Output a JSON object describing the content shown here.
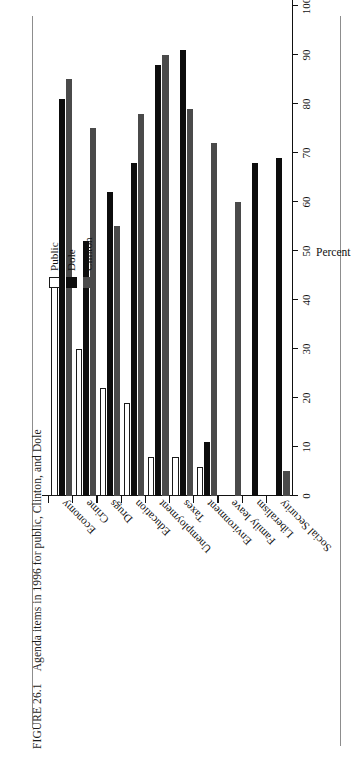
{
  "figure": {
    "number": "FIGURE 26.1",
    "caption": "Agenda items in 1996 for public, Clinton, and Dole"
  },
  "legend": {
    "position": "top-left-inside",
    "entries": [
      {
        "label": "Public",
        "color": "#ffffff",
        "style": "outlined"
      },
      {
        "label": "Dole",
        "color": "#0d0d0d",
        "style": "filled"
      },
      {
        "label": "Clinton",
        "color": "#4a4a4a",
        "style": "filled"
      }
    ]
  },
  "axes": {
    "value_title": "Percent",
    "value_ticks": [
      "0",
      "10",
      "20",
      "30",
      "40",
      "50",
      "60",
      "70",
      "80",
      "90",
      "100"
    ]
  },
  "chart_data": {
    "type": "bar",
    "orientation": "horizontal",
    "title": "Agenda items in 1996 for public, Clinton, and Dole",
    "xlabel": "",
    "ylabel": "Percent",
    "ylim": [
      0,
      100
    ],
    "grid": false,
    "legend_position": "top-left",
    "categories": [
      "Economy",
      "Crime",
      "Drugs",
      "Education",
      "Unemployment",
      "Taxes",
      "Environment",
      "Family leave",
      "Liberalism",
      "Social Security"
    ],
    "series": [
      {
        "name": "Public",
        "color": "#ffffff",
        "values": [
          44,
          30,
          22,
          19,
          8,
          8,
          6,
          0,
          0,
          0
        ]
      },
      {
        "name": "Dole",
        "color": "#0d0d0d",
        "values": [
          81,
          52,
          62,
          68,
          88,
          91,
          11,
          0,
          68,
          69
        ]
      },
      {
        "name": "Clinton",
        "color": "#4a4a4a",
        "values": [
          85,
          75,
          55,
          78,
          90,
          79,
          72,
          60,
          0,
          5
        ]
      }
    ]
  }
}
